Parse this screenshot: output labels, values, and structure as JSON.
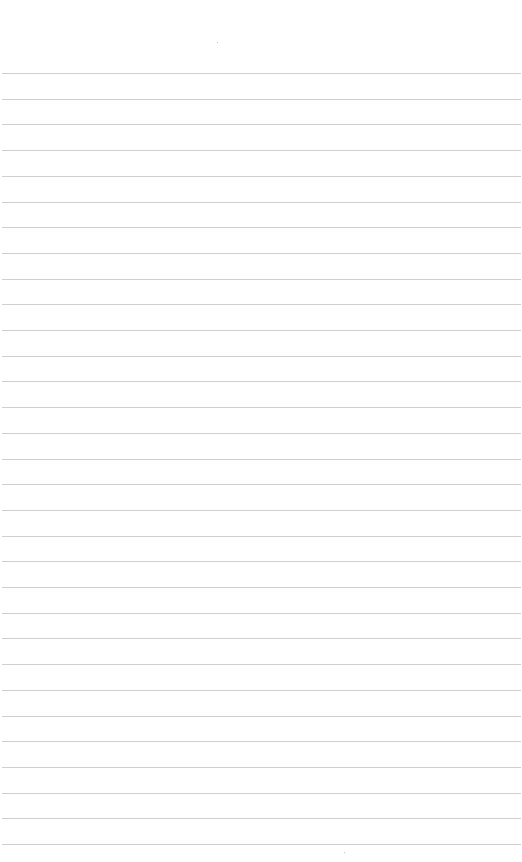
{
  "page": {
    "type": "ruled-paper",
    "background": "#ffffff",
    "line_color": "#cfcfcf",
    "first_line_y": 73,
    "line_pitch": 25.7,
    "line_count": 31,
    "text": ""
  }
}
